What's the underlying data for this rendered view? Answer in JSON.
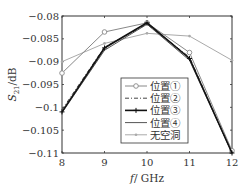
{
  "chart_data": {
    "type": "line",
    "title": "",
    "xlabel": "f/GHz",
    "ylabel": "S21/dB",
    "ylabel_main": "S",
    "ylabel_sub": "21",
    "ylabel_unit": "/dB",
    "xlabel_var": "f",
    "xlabel_unit": "/ GHz",
    "xlim": [
      8,
      12
    ],
    "ylim": [
      -0.11,
      -0.08
    ],
    "x": [
      8,
      9,
      10,
      11,
      12
    ],
    "xticks": [
      "8",
      "9",
      "10",
      "11",
      "12"
    ],
    "yticks": [
      "-0.08",
      "-0.085",
      "-0.09",
      "-0.095",
      "-0.1",
      "-0.105",
      "-0.11"
    ],
    "grid": false,
    "legend_position": "lower right (inside)",
    "series": [
      {
        "name": "位置①",
        "values": [
          -0.0925,
          -0.0835,
          -0.0815,
          -0.088,
          -0.1095
        ],
        "color": "#888888",
        "style": "solid",
        "marker": "circle"
      },
      {
        "name": "位置②",
        "values": [
          -0.1005,
          -0.0868,
          -0.0818,
          -0.089,
          -0.11
        ],
        "color": "#444444",
        "style": "dashdot",
        "marker": "none"
      },
      {
        "name": "位置③",
        "values": [
          -0.101,
          -0.087,
          -0.0815,
          -0.0893,
          -0.11
        ],
        "color": "#111111",
        "style": "solid-thick",
        "marker": "plus"
      },
      {
        "name": "位置④",
        "values": [
          -0.1012,
          -0.0875,
          -0.0818,
          -0.0897,
          -0.11
        ],
        "color": "#555555",
        "style": "solid",
        "marker": "none"
      },
      {
        "name": "无空洞",
        "values": [
          -0.09,
          -0.086,
          -0.0838,
          -0.0844,
          -0.0897
        ],
        "color": "#aaaaaa",
        "style": "solid",
        "marker": "dot"
      }
    ]
  }
}
